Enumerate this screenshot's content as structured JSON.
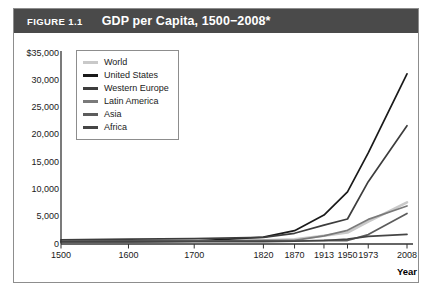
{
  "figure": {
    "label": "FIGURE 1.1",
    "title": "GDP per Capita, 1500−2008*"
  },
  "chart_data": {
    "type": "line",
    "title": "GDP per Capita, 1500−2008*",
    "xlabel": "Year",
    "ylabel": "",
    "x": [
      "1500",
      "1600",
      "1700",
      "1820",
      "1870",
      "1913",
      "1950",
      "1973",
      "2008"
    ],
    "categories": [
      "1500",
      "1600",
      "1700",
      "1820",
      "1870",
      "1913",
      "1950",
      "1973",
      "2008"
    ],
    "ylim": [
      0,
      35000
    ],
    "yticks": [
      0,
      5000,
      10000,
      15000,
      20000,
      25000,
      30000,
      35000
    ],
    "ytick_labels": [
      "0",
      "5,000",
      "10,000",
      "15,000",
      "20,000",
      "25,000",
      "30,000",
      "$35,000"
    ],
    "grid": false,
    "legend_position": "upper-left",
    "series": [
      {
        "name": "World",
        "color": "#c9c9c9",
        "values": [
          566,
          596,
          616,
          667,
          875,
          1525,
          2111,
          4083,
          7614
        ]
      },
      {
        "name": "United States",
        "color": "#1a1a1a",
        "values": [
          400,
          400,
          527,
          1257,
          2445,
          5301,
          9561,
          16689,
          31178
        ]
      },
      {
        "name": "Western Europe",
        "color": "#3d3d3d",
        "values": [
          771,
          889,
          997,
          1202,
          1960,
          3457,
          4578,
          11416,
          21672
        ]
      },
      {
        "name": "Latin America",
        "color": "#7a7a7a",
        "values": [
          416,
          438,
          527,
          691,
          676,
          1481,
          2503,
          4504,
          6973
        ]
      },
      {
        "name": "Asia",
        "color": "#5c5c5c",
        "values": [
          572,
          576,
          572,
          577,
          550,
          658,
          634,
          1718,
          5611
        ]
      },
      {
        "name": "Africa",
        "color": "#454545",
        "values": [
          414,
          422,
          421,
          420,
          500,
          637,
          890,
          1410,
          1780
        ]
      }
    ]
  },
  "legend": {
    "items": [
      {
        "label": "World",
        "color": "#c9c9c9"
      },
      {
        "label": "United States",
        "color": "#1a1a1a"
      },
      {
        "label": "Western Europe",
        "color": "#3d3d3d"
      },
      {
        "label": "Latin America",
        "color": "#7a7a7a"
      },
      {
        "label": "Asia",
        "color": "#5c5c5c"
      },
      {
        "label": "Africa",
        "color": "#454545"
      }
    ]
  }
}
